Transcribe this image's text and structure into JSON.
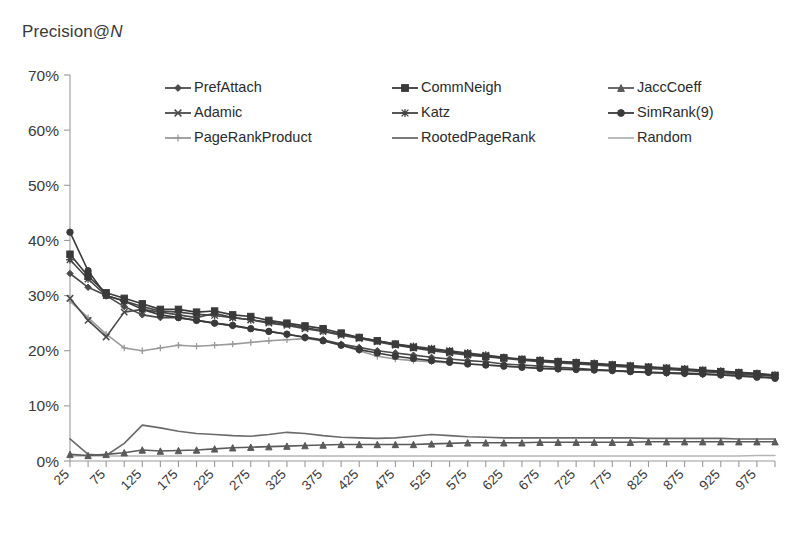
{
  "chart_data": {
    "type": "line",
    "title": "Precision@N",
    "xlabel": "",
    "ylabel": "",
    "ylim": [
      0,
      70
    ],
    "yunit": "%",
    "ytick_labels": [
      "0%",
      "10%",
      "20%",
      "30%",
      "40%",
      "50%",
      "60%",
      "70%"
    ],
    "ytick_values": [
      0,
      10,
      20,
      30,
      40,
      50,
      60,
      70
    ],
    "xlim": [
      25,
      1000
    ],
    "grid": false,
    "legend_position": "top-inside",
    "x": [
      25,
      50,
      75,
      100,
      125,
      150,
      175,
      200,
      225,
      250,
      275,
      300,
      325,
      350,
      375,
      400,
      425,
      450,
      475,
      500,
      525,
      550,
      575,
      600,
      625,
      650,
      675,
      700,
      725,
      750,
      775,
      800,
      825,
      850,
      875,
      900,
      925,
      950,
      975,
      1000
    ],
    "xtick_labels": [
      "25",
      "75",
      "125",
      "175",
      "225",
      "275",
      "325",
      "375",
      "425",
      "475",
      "525",
      "575",
      "625",
      "675",
      "725",
      "775",
      "825",
      "875",
      "925",
      "975"
    ],
    "series": [
      {
        "name": "PrefAttach",
        "marker": "diamond",
        "color": "#4a4a4a",
        "values": [
          34.0,
          31.5,
          30.0,
          28.0,
          26.5,
          26.0,
          26.0,
          25.5,
          25.0,
          24.5,
          24.0,
          23.5,
          23.0,
          22.5,
          22.0,
          21.2,
          20.6,
          20.0,
          19.6,
          19.2,
          18.8,
          18.5,
          18.2,
          18.0,
          17.6,
          17.4,
          17.2,
          17.0,
          16.8,
          16.6,
          16.4,
          16.2,
          16.0,
          15.9,
          15.8,
          15.7,
          15.6,
          15.5,
          15.3,
          15.1
        ]
      },
      {
        "name": "CommNeigh",
        "marker": "square",
        "color": "#3a3a3a",
        "values": [
          37.5,
          33.5,
          30.5,
          29.5,
          28.5,
          27.5,
          27.5,
          27.0,
          27.2,
          26.5,
          26.2,
          25.5,
          25.0,
          24.5,
          24.0,
          23.2,
          22.4,
          21.8,
          21.2,
          20.6,
          20.2,
          19.8,
          19.4,
          19.0,
          18.7,
          18.4,
          18.2,
          18.0,
          17.8,
          17.6,
          17.4,
          17.2,
          17.0,
          16.8,
          16.6,
          16.4,
          16.2,
          16.0,
          15.8,
          15.5
        ]
      },
      {
        "name": "JaccCoeff",
        "marker": "triangle",
        "color": "#5a5a5a",
        "values": [
          1.2,
          1.0,
          1.2,
          1.5,
          2.0,
          1.8,
          1.9,
          2.0,
          2.2,
          2.4,
          2.5,
          2.6,
          2.7,
          2.8,
          2.9,
          3.0,
          3.0,
          3.0,
          3.0,
          3.0,
          3.1,
          3.2,
          3.3,
          3.3,
          3.3,
          3.3,
          3.4,
          3.4,
          3.4,
          3.4,
          3.4,
          3.4,
          3.5,
          3.5,
          3.5,
          3.5,
          3.5,
          3.5,
          3.5,
          3.5
        ]
      },
      {
        "name": "Adamic",
        "marker": "cross",
        "color": "#4a4a4a",
        "values": [
          29.5,
          25.5,
          22.5,
          27.0,
          27.5,
          27.0,
          26.5,
          26.0,
          26.8,
          26.0,
          25.6,
          25.0,
          24.6,
          24.0,
          23.5,
          22.8,
          22.2,
          21.6,
          21.0,
          20.5,
          20.0,
          19.6,
          19.2,
          18.9,
          18.6,
          18.3,
          18.0,
          17.8,
          17.6,
          17.4,
          17.2,
          17.0,
          16.8,
          16.6,
          16.4,
          16.2,
          16.0,
          15.8,
          15.6,
          15.4
        ]
      },
      {
        "name": "Katz",
        "marker": "asterisk",
        "color": "#454545",
        "values": [
          36.5,
          33.0,
          30.0,
          29.0,
          28.0,
          27.2,
          27.0,
          26.6,
          26.4,
          26.0,
          25.6,
          25.2,
          24.8,
          24.2,
          23.6,
          23.0,
          22.4,
          21.8,
          21.2,
          20.8,
          20.4,
          20.0,
          19.6,
          19.2,
          18.8,
          18.5,
          18.3,
          18.1,
          17.9,
          17.7,
          17.5,
          17.3,
          17.1,
          16.9,
          16.7,
          16.5,
          16.3,
          16.1,
          15.9,
          15.6
        ]
      },
      {
        "name": "SimRank(9)",
        "marker": "circle",
        "color": "#3a3a3a",
        "values": [
          41.5,
          34.5,
          30.0,
          29.0,
          27.5,
          26.5,
          26.0,
          25.5,
          25.0,
          24.6,
          24.0,
          23.5,
          23.0,
          22.4,
          21.8,
          21.0,
          20.2,
          19.6,
          19.0,
          18.6,
          18.2,
          17.9,
          17.6,
          17.4,
          17.2,
          17.0,
          16.8,
          16.7,
          16.6,
          16.5,
          16.4,
          16.2,
          16.1,
          16.0,
          15.9,
          15.8,
          15.6,
          15.4,
          15.2,
          15.0
        ]
      },
      {
        "name": "PageRankProduct",
        "marker": "plus",
        "color": "#9a9a9a",
        "values": [
          29.0,
          26.0,
          23.0,
          20.5,
          20.0,
          20.5,
          21.0,
          20.8,
          21.0,
          21.2,
          21.5,
          21.8,
          22.0,
          22.2,
          21.8,
          21.0,
          20.0,
          19.0,
          18.5,
          18.2,
          18.0,
          17.8,
          17.6,
          17.4,
          17.2,
          17.0,
          16.8,
          16.6,
          16.5,
          16.4,
          16.3,
          16.2,
          16.1,
          16.0,
          15.9,
          15.8,
          15.7,
          15.6,
          15.5,
          15.4
        ]
      },
      {
        "name": "RootedPageRank",
        "marker": "none",
        "color": "#6a6a6a",
        "values": [
          4.0,
          1.2,
          1.0,
          3.2,
          6.5,
          6.0,
          5.4,
          5.0,
          4.8,
          4.6,
          4.5,
          4.8,
          5.2,
          5.0,
          4.6,
          4.3,
          4.2,
          4.1,
          4.2,
          4.5,
          4.8,
          4.6,
          4.4,
          4.3,
          4.2,
          4.2,
          4.2,
          4.2,
          4.2,
          4.2,
          4.2,
          4.2,
          4.1,
          4.1,
          4.1,
          4.1,
          4.1,
          4.0,
          4.0,
          4.0
        ]
      },
      {
        "name": "Random",
        "marker": "none",
        "color": "#b5b5b5",
        "values": [
          0.9,
          0.9,
          0.9,
          0.9,
          0.9,
          0.9,
          0.9,
          0.9,
          0.9,
          0.9,
          0.9,
          0.9,
          0.9,
          0.9,
          0.9,
          0.9,
          0.9,
          0.9,
          0.9,
          0.9,
          0.9,
          0.9,
          0.9,
          0.9,
          0.9,
          0.9,
          0.9,
          0.9,
          0.9,
          0.9,
          0.9,
          0.9,
          0.9,
          0.9,
          0.9,
          0.9,
          0.9,
          0.9,
          1.0,
          1.0
        ]
      }
    ],
    "legend": [
      {
        "label": "PrefAttach",
        "marker": "diamond",
        "color": "#4a4a4a"
      },
      {
        "label": "CommNeigh",
        "marker": "square",
        "color": "#3a3a3a"
      },
      {
        "label": "JaccCoeff",
        "marker": "triangle",
        "color": "#5a5a5a"
      },
      {
        "label": "Adamic",
        "marker": "cross",
        "color": "#4a4a4a"
      },
      {
        "label": "Katz",
        "marker": "asterisk",
        "color": "#454545"
      },
      {
        "label": "SimRank(9)",
        "marker": "circle",
        "color": "#3a3a3a"
      },
      {
        "label": "PageRankProduct",
        "marker": "plus",
        "color": "#9a9a9a"
      },
      {
        "label": "RootedPageRank",
        "marker": "none",
        "color": "#6a6a6a"
      },
      {
        "label": "Random",
        "marker": "none",
        "color": "#b5b5b5"
      }
    ]
  }
}
